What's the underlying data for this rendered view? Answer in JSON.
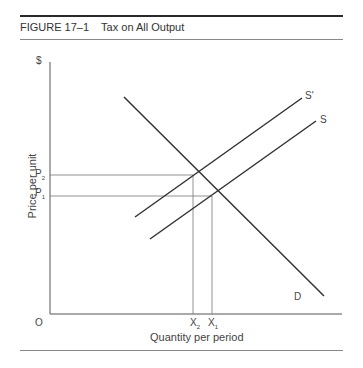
{
  "figure": {
    "number": "FIGURE 17–1",
    "title": "Tax on All Output",
    "caption": "FIGURE 17–1    Tax on All Output"
  },
  "axes": {
    "y_unit": "$",
    "y_label": "Price per unit",
    "x_label": "Quantity per period",
    "origin": "O"
  },
  "curves": {
    "demand": "D",
    "supply": "S",
    "supply_after_tax": "S'"
  },
  "ticks": {
    "p2": "P",
    "p2_sub": "2",
    "p1": "P",
    "p1_sub": "1",
    "x2": "X",
    "x2_sub": "2",
    "x1": "X",
    "x1_sub": "1"
  },
  "colors": {
    "line": "#333333",
    "guide": "#777777"
  }
}
